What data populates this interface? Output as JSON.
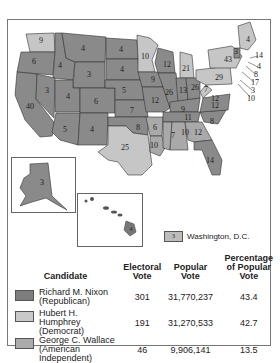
{
  "map": {
    "title": "1968 Presidential Election Electoral Map",
    "states": [
      {
        "id": "WA",
        "votes": "9",
        "winner": "Humphrey"
      },
      {
        "id": "OR",
        "votes": "6",
        "winner": "Nixon"
      },
      {
        "id": "CA",
        "votes": "40",
        "winner": "Nixon"
      },
      {
        "id": "ID",
        "votes": "4",
        "winner": "Nixon"
      },
      {
        "id": "NV",
        "votes": "3",
        "winner": "Nixon"
      },
      {
        "id": "MT",
        "votes": "4",
        "winner": "Nixon"
      },
      {
        "id": "WY",
        "votes": "3",
        "winner": "Nixon"
      },
      {
        "id": "UT",
        "votes": "4",
        "winner": "Nixon"
      },
      {
        "id": "AZ",
        "votes": "5",
        "winner": "Nixon"
      },
      {
        "id": "CO",
        "votes": "6",
        "winner": "Nixon"
      },
      {
        "id": "NM",
        "votes": "4",
        "winner": "Nixon"
      },
      {
        "id": "ND",
        "votes": "4",
        "winner": "Nixon"
      },
      {
        "id": "SD",
        "votes": "4",
        "winner": "Nixon"
      },
      {
        "id": "NE",
        "votes": "5",
        "winner": "Nixon"
      },
      {
        "id": "KS",
        "votes": "7",
        "winner": "Nixon"
      },
      {
        "id": "OK",
        "votes": "8",
        "winner": "Nixon"
      },
      {
        "id": "TX",
        "votes": "25",
        "winner": "Humphrey"
      },
      {
        "id": "MN",
        "votes": "10",
        "winner": "Humphrey"
      },
      {
        "id": "IA",
        "votes": "9",
        "winner": "Nixon"
      },
      {
        "id": "MO",
        "votes": "12",
        "winner": "Nixon"
      },
      {
        "id": "AR",
        "votes": "6",
        "winner": "Wallace"
      },
      {
        "id": "LA",
        "votes": "10",
        "winner": "Wallace"
      },
      {
        "id": "WI",
        "votes": "12",
        "winner": "Nixon"
      },
      {
        "id": "IL",
        "votes": "26",
        "winner": "Nixon"
      },
      {
        "id": "MI",
        "votes": "21",
        "winner": "Humphrey"
      },
      {
        "id": "IN",
        "votes": "13",
        "winner": "Nixon"
      },
      {
        "id": "OH",
        "votes": "26",
        "winner": "Nixon"
      },
      {
        "id": "KY",
        "votes": "9",
        "winner": "Nixon"
      },
      {
        "id": "TN",
        "votes": "11",
        "winner": "Nixon"
      },
      {
        "id": "MS",
        "votes": "7",
        "winner": "Wallace"
      },
      {
        "id": "AL",
        "votes": "10",
        "winner": "Wallace"
      },
      {
        "id": "GA",
        "votes": "12",
        "winner": "Wallace"
      },
      {
        "id": "FL",
        "votes": "14",
        "winner": "Nixon"
      },
      {
        "id": "SC",
        "votes": "8",
        "winner": "Nixon"
      },
      {
        "id": "NC",
        "votes": "12",
        "winner": "Nixon"
      },
      {
        "id": "VA",
        "votes": "12",
        "winner": "Nixon"
      },
      {
        "id": "WV",
        "votes": "7",
        "winner": "Humphrey"
      },
      {
        "id": "PA",
        "votes": "29",
        "winner": "Humphrey"
      },
      {
        "id": "NY",
        "votes": "43",
        "winner": "Humphrey"
      },
      {
        "id": "ME",
        "votes": "4",
        "winner": "Humphrey"
      },
      {
        "id": "VT",
        "votes": "3",
        "winner": "Nixon"
      },
      {
        "id": "AK",
        "votes": "3",
        "winner": "Nixon"
      },
      {
        "id": "HI",
        "votes": "4",
        "winner": "Humphrey"
      }
    ],
    "callouts": [
      {
        "id": "MA",
        "votes": "14"
      },
      {
        "id": "RI",
        "votes": "4"
      },
      {
        "id": "CT",
        "votes": "8"
      },
      {
        "id": "NJ",
        "votes": "17"
      },
      {
        "id": "DE",
        "votes": "3"
      },
      {
        "id": "MD",
        "votes": "10"
      },
      {
        "id": "NH",
        "votes": "4"
      }
    ],
    "dc": {
      "votes": "3",
      "label": "Washington, D.C."
    },
    "colors": {
      "nixon": "#8a8a8a",
      "humphrey": "#c6c6c6",
      "wallace": "#a9a9a9",
      "border": "#333333"
    }
  },
  "legend_table": {
    "headers": {
      "candidate": "Candidate",
      "electoral": "Electoral Vote",
      "popular": "Popular Vote",
      "percentage": "Percentage of Popular Vote"
    },
    "rows": [
      {
        "name": "Richard M. Nixon",
        "party": "(Republican)",
        "electoral": "301",
        "popular": "31,770,237",
        "percent": "43.4",
        "color": "#7d7d7d"
      },
      {
        "name": "Hubert H. Humphrey",
        "party": "(Democrat)",
        "electoral": "191",
        "popular": "31,270,533",
        "percent": "42.7",
        "color": "#c9c9c9"
      },
      {
        "name": "George C. Wallace",
        "party": "(American Independent)",
        "electoral": "46",
        "popular": "9,906,141",
        "percent": "13.5",
        "color": "#ababab"
      }
    ]
  }
}
